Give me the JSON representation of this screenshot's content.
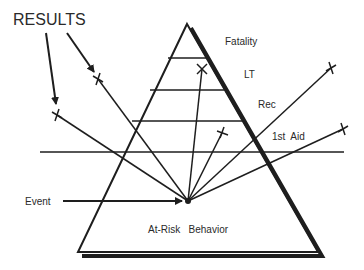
{
  "diagram": {
    "title_label": "RESULTS",
    "levels": [
      {
        "label": "Fatality"
      },
      {
        "label": "LT"
      },
      {
        "label": "Rec"
      },
      {
        "label": "1st  Aid"
      }
    ],
    "base_label": "At-Risk   Behavior",
    "event_label": "Event",
    "colors": {
      "line": "#1e1e1e",
      "text": "#2a2a2a",
      "background": "#ffffff"
    }
  }
}
